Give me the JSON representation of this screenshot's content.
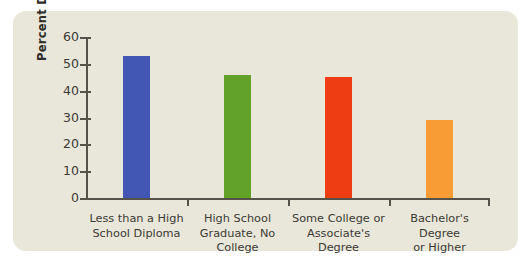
{
  "panel": {
    "background_color": "#e9e7d9",
    "page_background_color": "#ffffff"
  },
  "axis": {
    "y_title": "Percent Divorced",
    "y_ticks": [
      "0",
      "10",
      "20",
      "30",
      "40",
      "50",
      "60"
    ],
    "axis_color": "#55524a"
  },
  "chart_data": {
    "type": "bar",
    "title": "",
    "xlabel": "",
    "ylabel": "Percent Divorced",
    "ylim": [
      0,
      60
    ],
    "ytick_step": 10,
    "grid": false,
    "legend": "none",
    "categories": [
      "Less than a High\nSchool Diploma",
      "High School\nGraduate, No\nCollege",
      "Some College or\nAssociate's Degree",
      "Bachelor's Degree\nor Higher"
    ],
    "values": [
      53,
      46,
      45,
      29
    ],
    "colors": [
      "#4256b3",
      "#62a228",
      "#ee3d12",
      "#f89c35"
    ],
    "series": [
      {
        "name": "Percent Divorced",
        "values": [
          53,
          46,
          45,
          29
        ]
      }
    ]
  }
}
